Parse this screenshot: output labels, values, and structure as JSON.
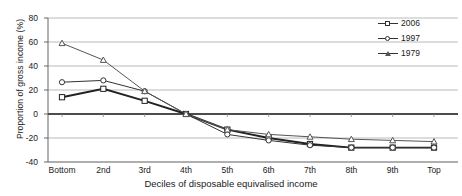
{
  "chart_data": {
    "type": "line",
    "title": "",
    "xlabel": "Deciles of disposable equivalised income",
    "ylabel": "Proportion of gross income (%)",
    "categories": [
      "Bottom",
      "2nd",
      "3rd",
      "4th",
      "5th",
      "6th",
      "7th",
      "8th",
      "9th",
      "Top"
    ],
    "ylim": [
      -40,
      80
    ],
    "yticks": [
      80,
      60,
      40,
      20,
      0,
      -20,
      -40
    ],
    "ytick_labels": [
      "80",
      "60",
      "40",
      "20",
      "0",
      "-20",
      "-40"
    ],
    "grid": "horizontal",
    "legend_position": "top-right",
    "series": [
      {
        "name": "2006",
        "marker": "square",
        "color": "#222222",
        "values": [
          14,
          21,
          11,
          0,
          -13,
          -20,
          -25,
          -28,
          -28,
          -28
        ]
      },
      {
        "name": "1997",
        "marker": "circle",
        "color": "#333333",
        "values": [
          26.5,
          28,
          19,
          0,
          -17,
          -22,
          -26,
          -28,
          -28,
          -28
        ]
      },
      {
        "name": "1979",
        "marker": "triangle",
        "color": "#555555",
        "values": [
          59,
          45,
          19,
          0,
          -13,
          -17,
          -19,
          -21,
          -22,
          -23
        ]
      }
    ]
  },
  "legend": {
    "items": [
      {
        "label": "2006",
        "marker": "square"
      },
      {
        "label": "1997",
        "marker": "circle"
      },
      {
        "label": "1979",
        "marker": "triangle"
      }
    ]
  }
}
